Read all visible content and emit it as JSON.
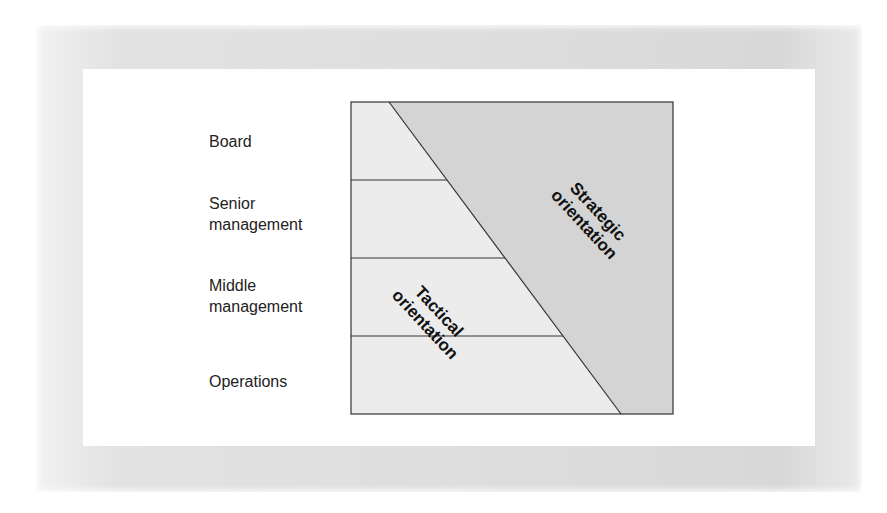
{
  "diagram": {
    "levels": [
      {
        "label": "Board"
      },
      {
        "label": "Senior\nmanagement"
      },
      {
        "label": "Middle\nmanagement"
      },
      {
        "label": "Operations"
      }
    ],
    "regions": {
      "tactical": {
        "label": "Tactical\norientation",
        "color": "#ececec"
      },
      "strategic": {
        "label": "Strategic\norientation",
        "color": "#d4d4d4"
      }
    },
    "colors": {
      "line": "#333333",
      "frame": "#dddddd",
      "background": "#ffffff"
    }
  }
}
